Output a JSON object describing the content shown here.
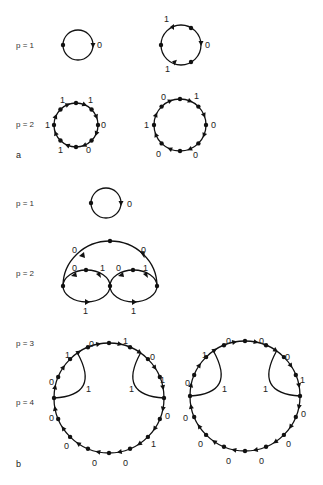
{
  "figure": {
    "panels": [
      {
        "id": "a",
        "label": "a",
        "rows": [
          {
            "label": "p = 1",
            "graphs": [
              {
                "name": "a-p1-cycle1",
                "nodes": 1,
                "edge_labels": [
                  "0"
                ]
              },
              {
                "name": "a-p1-cycle2",
                "nodes": 4,
                "edge_labels": [
                  "1",
                  "0",
                  "1"
                ]
              }
            ]
          },
          {
            "label": "p = 2",
            "graphs": [
              {
                "name": "a-p2-cycle1",
                "nodes": 8,
                "edge_labels": [
                  "1",
                  "1",
                  "1",
                  "0",
                  "0",
                  "1"
                ]
              },
              {
                "name": "a-p2-cycle2",
                "nodes": 8,
                "edge_labels": [
                  "0",
                  "1",
                  "0",
                  "0",
                  "0",
                  "1"
                ]
              }
            ]
          }
        ]
      },
      {
        "id": "b",
        "label": "b",
        "rows": [
          {
            "label": "p = 1",
            "graphs": [
              {
                "name": "b-p1-cycle",
                "nodes": 1,
                "edge_labels": [
                  "0"
                ]
              }
            ]
          },
          {
            "label": "p = 2",
            "graphs": [
              {
                "name": "b-p2-graph",
                "edge_labels": [
                  "0",
                  "0",
                  "0",
                  "1",
                  "0",
                  "1",
                  "1",
                  "1"
                ]
              }
            ]
          },
          {
            "label": "p = 3",
            "graphs": []
          },
          {
            "label": "p = 4",
            "graphs": [
              {
                "name": "b-p4-graph1",
                "edge_labels": [
                  "0",
                  "1",
                  "1",
                  "0",
                  "0",
                  "1",
                  "1",
                  "1",
                  "0",
                  "0",
                  "1",
                  "0",
                  "0",
                  "0"
                ]
              },
              {
                "name": "b-p4-graph2",
                "edge_labels": [
                  "0",
                  "0",
                  "1",
                  "0",
                  "0",
                  "1",
                  "1",
                  "1",
                  "0",
                  "0",
                  "0",
                  "0",
                  "0",
                  "0"
                ]
              }
            ]
          }
        ]
      }
    ]
  },
  "text": {
    "a_p1": "p = 1",
    "a_p2": "p = 2",
    "a_label": "a",
    "b_p1": "p = 1",
    "b_p2": "p = 2",
    "b_p3": "p = 3",
    "b_p4": "p = 4",
    "b_label": "b",
    "a1": {
      "e0": "0"
    },
    "a2": {
      "e0": "1",
      "e1": "0",
      "e2": "1"
    },
    "a3": {
      "e0": "1",
      "e1": "1",
      "e2": "1",
      "e3": "0",
      "e4": "1",
      "e5": "0"
    },
    "a4": {
      "e0": "0",
      "e1": "1",
      "e2": "1",
      "e3": "0",
      "e4": "0",
      "e5": "0"
    },
    "b1": {
      "e0": "0"
    },
    "b2": {
      "e0": "0",
      "e1": "0",
      "e2": "0",
      "e3": "1",
      "e4": "0",
      "e5": "1",
      "e6": "1",
      "e7": "1"
    },
    "b4L": {
      "e0": "0",
      "e1": "1",
      "e2": "1",
      "e3": "0",
      "e4": "1",
      "e5": "0",
      "e6": "1",
      "e7": "1",
      "e8": "0",
      "e9": "0",
      "e10": "0",
      "e11": "0",
      "e12": "0",
      "e13": "1"
    },
    "b4R": {
      "e0": "0",
      "e1": "0",
      "e2": "1",
      "e3": "0",
      "e4": "1",
      "e5": "0",
      "e6": "1",
      "e7": "1",
      "e8": "0",
      "e9": "0",
      "e10": "0",
      "e11": "0",
      "e12": "0",
      "e13": "0"
    }
  }
}
